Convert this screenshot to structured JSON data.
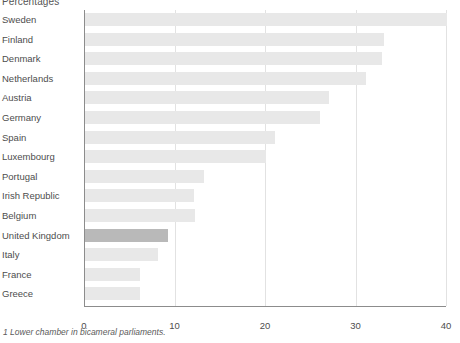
{
  "chart_data": {
    "type": "bar",
    "orientation": "horizontal",
    "title": "Percentages",
    "xlabel": "",
    "ylabel": "",
    "xlim": [
      0,
      40
    ],
    "xticks": [
      0,
      10,
      20,
      30,
      40
    ],
    "grid": true,
    "legend": null,
    "categories": [
      "Sweden",
      "Finland",
      "Denmark",
      "Netherlands",
      "Austria",
      "Germany",
      "Spain",
      "Luxembourg",
      "Portugal",
      "Irish Republic",
      "Belgium",
      "United Kingdom",
      "Italy",
      "France",
      "Greece"
    ],
    "values": [
      40.0,
      33.0,
      32.8,
      31.0,
      27.0,
      26.0,
      21.0,
      20.0,
      13.1,
      12.0,
      12.1,
      9.2,
      8.1,
      6.1,
      6.1
    ],
    "highlight_category": "United Kingdom",
    "colors": {
      "bar": "#e8e8e8",
      "bar_highlight": "#b9b9b9",
      "axis": "#8c8c8c",
      "grid": "#e2e2e2",
      "text": "#4d4d4d"
    }
  },
  "footnote": "1 Lower chamber in bicameral parliaments."
}
